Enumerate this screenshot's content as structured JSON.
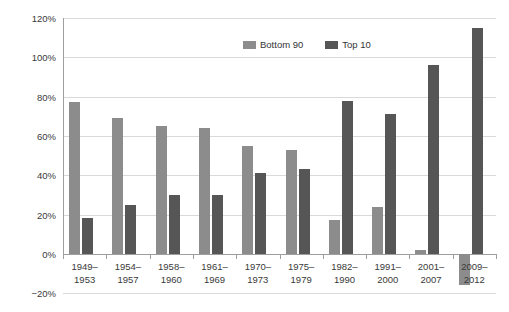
{
  "chart_data": {
    "type": "bar",
    "title": "",
    "xlabel": "",
    "ylabel": "",
    "ylim": [
      -20,
      120
    ],
    "ytick_labels": [
      "120%",
      "100%",
      "80%",
      "60%",
      "40%",
      "20%",
      "0%",
      "−20%"
    ],
    "yticks": [
      120,
      100,
      80,
      60,
      40,
      20,
      0,
      -20
    ],
    "grid": true,
    "legend_position": "top-center",
    "categories": [
      "1949–1953",
      "1954–1957",
      "1958–1960",
      "1961–1969",
      "1970–1973",
      "1975–1979",
      "1982–1990",
      "1991–2000",
      "2001–2007",
      "2009–2012"
    ],
    "category_lines": [
      [
        "1949–",
        "1953"
      ],
      [
        "1954–",
        "1957"
      ],
      [
        "1958–",
        "1960"
      ],
      [
        "1961–",
        "1969"
      ],
      [
        "1970–",
        "1973"
      ],
      [
        "1975–",
        "1979"
      ],
      [
        "1982–",
        "1990"
      ],
      [
        "1991–",
        "2000"
      ],
      [
        "2001–",
        "2007"
      ],
      [
        "2009–",
        "2012"
      ]
    ],
    "series": [
      {
        "name": "Bottom 90",
        "color": "#8c8c8c",
        "values": [
          77,
          69,
          65,
          64,
          55,
          53,
          17,
          24,
          2,
          -16
        ]
      },
      {
        "name": "Top 10",
        "color": "#565656",
        "values": [
          18,
          25,
          30,
          30,
          41,
          43,
          78,
          71,
          96,
          115
        ]
      }
    ]
  },
  "legend": {
    "items": [
      {
        "label": "Bottom 90",
        "color": "#8c8c8c"
      },
      {
        "label": "Top 10",
        "color": "#565656"
      }
    ]
  }
}
